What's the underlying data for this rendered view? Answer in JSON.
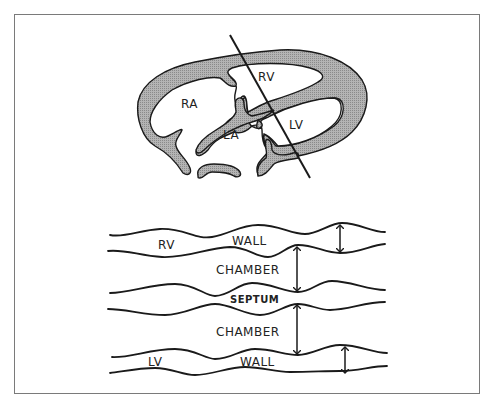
{
  "figure": {
    "type": "echocardiography schematic",
    "colors": {
      "frame_border": "#7a7a7a",
      "ink": "#1a1a1a",
      "tissue_fill": "#a9a9a9",
      "background": "#ffffff"
    }
  },
  "heart_diagram": {
    "labels": {
      "ra": "RA",
      "rv": "RV",
      "la": "LA",
      "lv": "LV"
    },
    "cut_line": "scan-line"
  },
  "m_mode_diagram": {
    "labels": {
      "rv": "RV",
      "rv_wall": "WALL",
      "rv_chamber": "CHAMBER",
      "septum": "SEPTUM",
      "lv_chamber": "CHAMBER",
      "lv": "LV",
      "lv_wall": "WALL"
    }
  }
}
